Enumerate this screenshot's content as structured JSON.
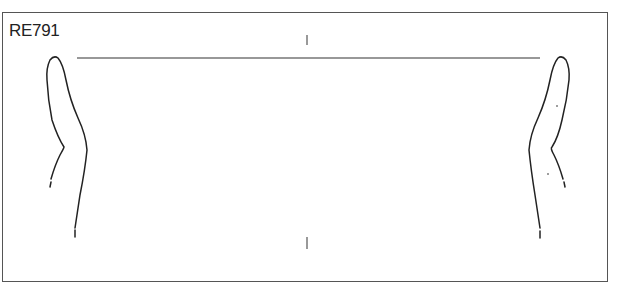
{
  "figure": {
    "label": "RE791",
    "type": "pottery profile drawing (rim sherd, symmetric cross-section)",
    "colors": {
      "line": "#222222",
      "frame": "#555555",
      "background": "#ffffff"
    }
  }
}
